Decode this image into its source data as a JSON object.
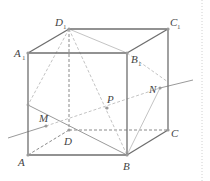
{
  "figure": {
    "type": "cube-geometry",
    "colors": {
      "edge": "#6e6e6e",
      "hidden": "#8a8a8a",
      "construction": "#c4c4c4",
      "point": "#9a9a9a",
      "divider": "#cfcfcf"
    },
    "labels": {
      "A": "A",
      "B": "B",
      "C": "C",
      "D": "D",
      "A1": "A",
      "B1": "B",
      "C1": "C",
      "D1": "D",
      "sub1": "1",
      "M": "M",
      "N": "N",
      "P": "P"
    }
  }
}
